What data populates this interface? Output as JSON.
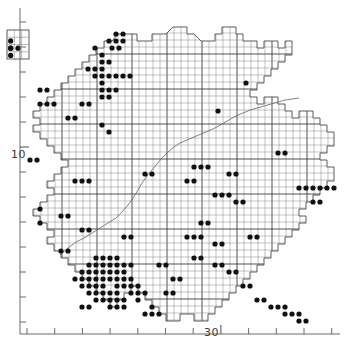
{
  "figure": {
    "type": "distribution-atlas-map",
    "title": ""
  },
  "axes": {
    "y_axis": {
      "name": "northing-axis",
      "labels": [
        {
          "text": "10",
          "value": 10,
          "y_px": 154
        }
      ],
      "tick_count": 13,
      "tick_top_px": 22,
      "tick_bottom_px": 322,
      "tick_spacing_px": 25,
      "major_tick_indices": [
        5
      ],
      "axis_x_px": 20
    },
    "x_axis": {
      "name": "easting-axis",
      "labels": [
        {
          "text": "30",
          "value": 30,
          "x_px": 204
        }
      ],
      "tick_count": 12,
      "tick_left_px": 27,
      "tick_right_px": 332,
      "tick_spacing_px": 27.7,
      "major_tick_indices": [
        7
      ],
      "axis_y_px": 334
    },
    "frame_color": "#5a5a5a"
  },
  "grid": {
    "cell_size_px": 7,
    "minor_color": "#7a7a7a",
    "major_color": "#333333",
    "major_every": 5,
    "origin_x_px": 27,
    "origin_y_px": 19
  },
  "symbols": {
    "dot": {
      "name": "record-dot",
      "shape": "filled-circle",
      "radius_px": 2.6,
      "color": "#111111",
      "meaning": "species recorded in 10 km square"
    },
    "empty_cell": {
      "name": "empty-grid-square",
      "shape": "open-square",
      "color": "#7a7a7a",
      "meaning": "surveyed square with no record"
    }
  },
  "inset": {
    "name": "island-inset",
    "x_px": 7,
    "y_px": 30,
    "width_px": 22,
    "height_px": 29,
    "cols": 3,
    "rows": 4,
    "dots": [
      [
        0,
        1
      ],
      [
        0,
        2
      ],
      [
        0,
        2
      ],
      [
        0,
        3
      ],
      [
        1,
        2
      ]
    ]
  },
  "chart_data": {
    "type": "scatter",
    "title": "",
    "xlabel": "",
    "ylabel": "",
    "grid": true,
    "xlim": [
      27,
      335
    ],
    "ylim": [
      19,
      325
    ],
    "legend": [],
    "note": "Dot positions are pixel coordinates of occupied 10 km grid squares",
    "dots_px": [
      [
        109,
        41
      ],
      [
        116,
        41
      ],
      [
        123,
        41
      ],
      [
        116,
        34
      ],
      [
        123,
        34
      ],
      [
        112,
        48
      ],
      [
        119,
        48
      ],
      [
        95,
        48
      ],
      [
        102,
        55
      ],
      [
        102,
        62
      ],
      [
        109,
        62
      ],
      [
        88,
        69
      ],
      [
        95,
        69
      ],
      [
        102,
        69
      ],
      [
        95,
        76
      ],
      [
        102,
        76
      ],
      [
        109,
        76
      ],
      [
        116,
        76
      ],
      [
        123,
        76
      ],
      [
        130,
        76
      ],
      [
        102,
        83
      ],
      [
        102,
        90
      ],
      [
        109,
        90
      ],
      [
        116,
        90
      ],
      [
        102,
        97
      ],
      [
        109,
        97
      ],
      [
        40,
        104
      ],
      [
        47,
        104
      ],
      [
        54,
        104
      ],
      [
        82,
        104
      ],
      [
        89,
        104
      ],
      [
        218,
        111
      ],
      [
        246,
        83
      ],
      [
        102,
        125
      ],
      [
        109,
        132
      ],
      [
        30,
        160
      ],
      [
        37,
        160
      ],
      [
        75,
        181
      ],
      [
        82,
        181
      ],
      [
        89,
        181
      ],
      [
        145,
        174
      ],
      [
        152,
        174
      ],
      [
        194,
        167
      ],
      [
        201,
        167
      ],
      [
        208,
        167
      ],
      [
        187,
        181
      ],
      [
        194,
        181
      ],
      [
        229,
        174
      ],
      [
        236,
        174
      ],
      [
        299,
        188
      ],
      [
        306,
        188
      ],
      [
        313,
        188
      ],
      [
        320,
        188
      ],
      [
        327,
        188
      ],
      [
        334,
        188
      ],
      [
        215,
        195
      ],
      [
        222,
        195
      ],
      [
        229,
        195
      ],
      [
        236,
        202
      ],
      [
        243,
        202
      ],
      [
        61,
        216
      ],
      [
        68,
        216
      ],
      [
        40,
        209
      ],
      [
        40,
        223
      ],
      [
        82,
        230
      ],
      [
        89,
        230
      ],
      [
        187,
        237
      ],
      [
        194,
        237
      ],
      [
        201,
        237
      ],
      [
        215,
        244
      ],
      [
        222,
        244
      ],
      [
        96,
        258
      ],
      [
        103,
        258
      ],
      [
        110,
        258
      ],
      [
        117,
        258
      ],
      [
        89,
        265
      ],
      [
        96,
        265
      ],
      [
        103,
        265
      ],
      [
        110,
        265
      ],
      [
        117,
        265
      ],
      [
        124,
        265
      ],
      [
        131,
        265
      ],
      [
        82,
        272
      ],
      [
        89,
        272
      ],
      [
        96,
        272
      ],
      [
        103,
        272
      ],
      [
        110,
        272
      ],
      [
        117,
        272
      ],
      [
        124,
        272
      ],
      [
        75,
        279
      ],
      [
        82,
        279
      ],
      [
        89,
        279
      ],
      [
        96,
        279
      ],
      [
        103,
        279
      ],
      [
        110,
        279
      ],
      [
        117,
        279
      ],
      [
        124,
        279
      ],
      [
        131,
        279
      ],
      [
        82,
        286
      ],
      [
        89,
        286
      ],
      [
        96,
        286
      ],
      [
        103,
        286
      ],
      [
        117,
        286
      ],
      [
        124,
        286
      ],
      [
        131,
        286
      ],
      [
        138,
        286
      ],
      [
        89,
        293
      ],
      [
        96,
        293
      ],
      [
        103,
        293
      ],
      [
        110,
        293
      ],
      [
        117,
        293
      ],
      [
        131,
        293
      ],
      [
        138,
        293
      ],
      [
        145,
        293
      ],
      [
        96,
        300
      ],
      [
        103,
        300
      ],
      [
        110,
        300
      ],
      [
        117,
        300
      ],
      [
        124,
        300
      ],
      [
        138,
        300
      ],
      [
        110,
        307
      ],
      [
        117,
        307
      ],
      [
        124,
        307
      ],
      [
        152,
        307
      ],
      [
        145,
        314
      ],
      [
        152,
        314
      ],
      [
        159,
        314
      ],
      [
        166,
        293
      ],
      [
        173,
        293
      ],
      [
        173,
        279
      ],
      [
        180,
        279
      ],
      [
        159,
        265
      ],
      [
        166,
        265
      ],
      [
        194,
        258
      ],
      [
        201,
        258
      ],
      [
        215,
        265
      ],
      [
        222,
        265
      ],
      [
        229,
        272
      ],
      [
        236,
        272
      ],
      [
        243,
        286
      ],
      [
        250,
        286
      ],
      [
        257,
        300
      ],
      [
        264,
        300
      ],
      [
        271,
        307
      ],
      [
        278,
        307
      ],
      [
        285,
        307
      ],
      [
        285,
        314
      ],
      [
        292,
        314
      ],
      [
        299,
        314
      ],
      [
        299,
        321
      ],
      [
        306,
        321
      ],
      [
        82,
        307
      ],
      [
        89,
        307
      ],
      [
        61,
        251
      ],
      [
        68,
        251
      ],
      [
        124,
        237
      ],
      [
        131,
        237
      ],
      [
        278,
        153
      ],
      [
        285,
        153
      ],
      [
        313,
        202
      ],
      [
        320,
        202
      ],
      [
        40,
        90
      ],
      [
        47,
        90
      ],
      [
        68,
        118
      ],
      [
        75,
        118
      ],
      [
        250,
        237
      ],
      [
        257,
        237
      ],
      [
        201,
        223
      ],
      [
        208,
        223
      ]
    ]
  }
}
